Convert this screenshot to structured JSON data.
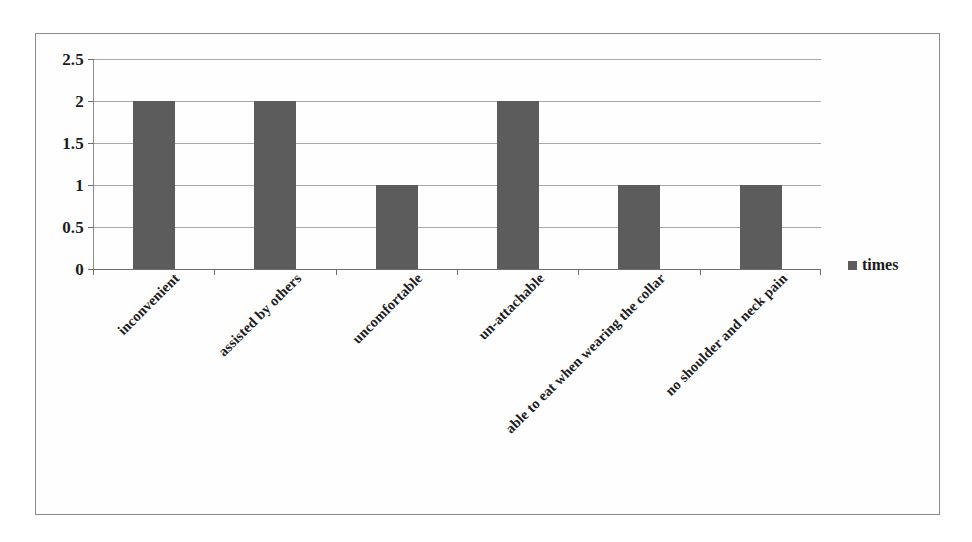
{
  "chart_data": {
    "type": "bar",
    "title": "",
    "xlabel": "",
    "ylabel": "",
    "categories": [
      "inconvenient",
      "assisted by others",
      "uncomfortable",
      "un-attachable",
      "able to eat when wearing the collar",
      "no shoulder and neck pain"
    ],
    "series": [
      {
        "name": "times",
        "values": [
          2,
          2,
          1,
          2,
          1,
          1
        ],
        "color": "#5c5c5c"
      }
    ],
    "ylim": [
      0,
      2.5
    ],
    "ytick_labels": [
      "0",
      "0.5",
      "1",
      "1.5",
      "2",
      "2.5"
    ],
    "ytick_values": [
      0,
      0.5,
      1,
      1.5,
      2,
      2.5
    ],
    "grid": "horizontal",
    "legend_position": "right"
  },
  "legend": {
    "entries": [
      {
        "label": "times",
        "color": "#5c5c5c",
        "marker": "square-marker-icon"
      }
    ]
  },
  "axis": {
    "y_labels": [
      "2.5",
      "2",
      "1.5",
      "1",
      "0.5",
      "0"
    ]
  },
  "colors": {
    "bar": "#5c5c5c",
    "gridline": "#a8a8a8",
    "axis": "#6f6f6f",
    "frame": "#8b8b8b",
    "text": "#1c1c1c",
    "background": "#ffffff"
  }
}
